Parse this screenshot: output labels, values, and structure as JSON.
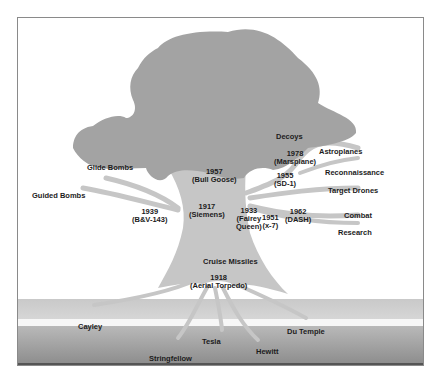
{
  "diagram": {
    "type": "tree-metaphor",
    "colors": {
      "canopy": "#a3a3a3",
      "trunk": "#c6c6c6",
      "ground_light": "#cfcfcf",
      "ground_dark": "#9a9a9a",
      "frame_border": "#8a8a8a",
      "text": "#1c1c1c"
    },
    "branches": {
      "decoys": "Decoys",
      "astroplanes": "Astroplanes",
      "reconnaissance": "Reconnaissance",
      "target_drones": "Target Drones",
      "combat": "Combat",
      "research": "Research",
      "glide_bombs": "Glide Bombs",
      "guided_bombs": "Guided Bombs",
      "cruise_missiles": "Cruise Missiles"
    },
    "milestones": {
      "m1957": {
        "year": "1957",
        "name": "(Bull Goose)"
      },
      "m1978": {
        "year": "1978",
        "name": "(Marsplane)"
      },
      "m1955": {
        "year": "1955",
        "name": "(SD-1)"
      },
      "m1917": {
        "year": "1917",
        "name": "(Siemens)"
      },
      "m1939": {
        "year": "1939",
        "name": "(B&V-143)"
      },
      "m1933": {
        "year": "1933",
        "name1": "(Fairey",
        "name2": "Queen)"
      },
      "m1951": {
        "year": "1951",
        "name": "(x-7)"
      },
      "m1962": {
        "year": "1962",
        "name": "(DASH)"
      },
      "m1918": {
        "year": "1918",
        "name": "(Aerial Torpedo)"
      }
    },
    "roots": {
      "cayley": "Cayley",
      "stringfellow": "Stringfellow",
      "tesla": "Tesla",
      "hewitt": "Hewitt",
      "du_temple": "Du Temple"
    }
  }
}
